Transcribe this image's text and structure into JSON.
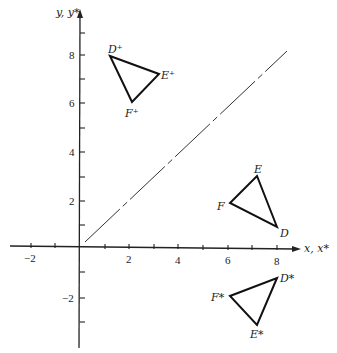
{
  "diagram": {
    "title": "",
    "axes": {
      "x_label": "x, x*",
      "y_label": "y, y*",
      "x_ticks": [
        {
          "value": -2,
          "label": "−2"
        },
        {
          "value": 2,
          "label": "2"
        },
        {
          "value": 4,
          "label": "4"
        },
        {
          "value": 6,
          "label": "6"
        },
        {
          "value": 8,
          "label": "8"
        }
      ],
      "y_ticks": [
        {
          "value": 8,
          "label": "8"
        },
        {
          "value": 6,
          "label": "6"
        },
        {
          "value": 4,
          "label": "4"
        },
        {
          "value": 2,
          "label": "2"
        },
        {
          "value": -2,
          "label": "−2"
        }
      ],
      "x_range": [
        -3,
        9
      ],
      "y_range": [
        -4,
        9.5
      ]
    },
    "reflection_line": {
      "equation": "y = x",
      "style": "dash-dot",
      "from": [
        0.2,
        0.2
      ],
      "to": [
        8,
        8
      ]
    },
    "triangles": [
      {
        "name": "original",
        "vertices": [
          {
            "label": "D",
            "x": 8.0,
            "y": 0.8
          },
          {
            "label": "E",
            "x": 7.2,
            "y": 2.9
          },
          {
            "label": "F",
            "x": 6.1,
            "y": 1.8
          }
        ]
      },
      {
        "name": "reflected-about-y-equals-x",
        "vertices": [
          {
            "label": "D⁺",
            "x": 1.0,
            "y": 8.0
          },
          {
            "label": "E⁺",
            "x": 3.2,
            "y": 7.1
          },
          {
            "label": "F⁺",
            "x": 2.1,
            "y": 5.9
          }
        ]
      },
      {
        "name": "reflected-about-x-axis",
        "vertices": [
          {
            "label": "D*",
            "x": 8.0,
            "y": -1.2
          },
          {
            "label": "E*",
            "x": 7.2,
            "y": -2.9
          },
          {
            "label": "F*",
            "x": 6.1,
            "y": -1.9
          }
        ]
      }
    ]
  }
}
